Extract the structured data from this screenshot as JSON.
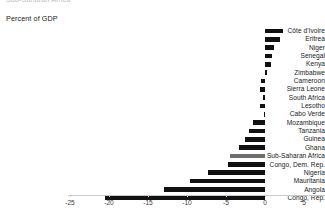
{
  "header": {
    "clipped_top_text": "Sub-Saharan Africa",
    "axis_title": "Percent of GDP"
  },
  "chart_data": {
    "type": "bar",
    "orientation": "horizontal",
    "title": "Percent of GDP",
    "xlabel": "",
    "ylabel": "",
    "xlim": [
      -25,
      5
    ],
    "xticks": [
      -25,
      -20,
      -15,
      -10,
      -5,
      0,
      5
    ],
    "xticklabels": [
      "-25",
      "-20",
      "-15",
      "-10",
      "-5",
      "0",
      "5"
    ],
    "grid": false,
    "legend": null,
    "bar_color": "#111111",
    "highlight_color": "#6e6e6e",
    "highlight_category": "Sub-Saharan Africa",
    "categories": [
      "Côte d'Ivoire",
      "Eritrea",
      "Niger",
      "Senegal",
      "Kenya",
      "Zimbabwe",
      "Cameroon",
      "Sierra Leone",
      "South Africa",
      "Lesotho",
      "Cabo Verde",
      "Mozambique",
      "Tanzania",
      "Guinea",
      "Ghana",
      "Sub-Saharan Africa",
      "Congo, Dem. Rep.",
      "Nigeria",
      "Mauritania",
      "Angola",
      "Congo, Rep."
    ],
    "values": [
      2.3,
      1.9,
      1.2,
      0.9,
      0.8,
      0.2,
      -0.5,
      -0.6,
      -0.2,
      -0.7,
      -0.1,
      -1.5,
      -2.0,
      -2.6,
      -3.3,
      -4.5,
      -4.8,
      -7.3,
      -9.6,
      -13.0,
      -20.5
    ]
  }
}
